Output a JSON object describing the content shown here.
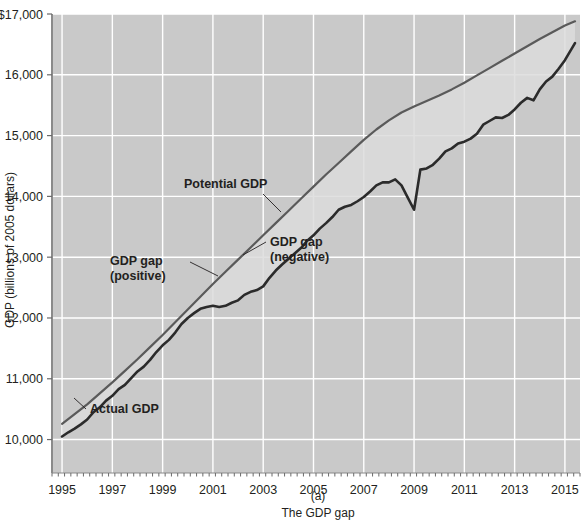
{
  "figure": {
    "caption_label": "(a)",
    "caption_text": "The GDP gap",
    "background": "#ffffff",
    "plot_background": "#c9c9c9",
    "gridline_color": "#ffffff",
    "potential_color": "#5a5a5a",
    "actual_color": "#2b2b2b",
    "gap_fill": "#dcdcdc"
  },
  "chart_data": {
    "type": "line",
    "title": "",
    "subtitle": "",
    "xlabel": "",
    "ylabel": "GDP (billions of 2005 dollars)",
    "xlim": [
      1994.6,
      2015.6
    ],
    "ylim": [
      9450,
      17000
    ],
    "grid": true,
    "legend": "none",
    "ytick_labels": [
      "$17,000",
      "16,000",
      "15,000",
      "14,000",
      "13,000",
      "12,000",
      "11,000",
      "10,000"
    ],
    "yticks": [
      17000,
      16000,
      15000,
      14000,
      13000,
      12000,
      11000,
      10000
    ],
    "xtick_labels": [
      "1995",
      "1997",
      "1999",
      "2001",
      "2003",
      "2005",
      "2007",
      "2009",
      "2011",
      "2013",
      "2015"
    ],
    "xticks": [
      1995,
      1997,
      1999,
      2001,
      2003,
      2005,
      2007,
      2009,
      2011,
      2013,
      2015
    ],
    "annotations": [
      {
        "name": "potential-gdp",
        "text": "Potential GDP",
        "x": 2000.6,
        "y": 13800
      },
      {
        "name": "gdp-gap-positive",
        "text_line1": "GDP gap",
        "text_line2": "(positive)",
        "x": 1999.2,
        "y": 12700
      },
      {
        "name": "gdp-gap-negative",
        "text_line1": "GDP gap",
        "text_line2": "(negative)",
        "x": 2003.3,
        "y": 12950
      },
      {
        "name": "actual-gdp",
        "text": "Actual GDP",
        "x": 1996.1,
        "y": 10050
      }
    ],
    "series": [
      {
        "name": "Potential GDP",
        "color": "#5a5a5a",
        "x": [
          1995.0,
          1995.5,
          1996.0,
          1996.5,
          1997.0,
          1997.5,
          1998.0,
          1998.5,
          1999.0,
          1999.5,
          2000.0,
          2000.5,
          2001.0,
          2001.5,
          2002.0,
          2002.5,
          2003.0,
          2003.5,
          2004.0,
          2004.5,
          2005.0,
          2005.5,
          2006.0,
          2006.5,
          2007.0,
          2007.5,
          2008.0,
          2008.5,
          2009.0,
          2009.5,
          2010.0,
          2010.5,
          2011.0,
          2011.5,
          2012.0,
          2012.5,
          2013.0,
          2013.5,
          2014.0,
          2014.5,
          2015.0,
          2015.4
        ],
        "values": [
          10260,
          10420,
          10580,
          10760,
          10940,
          11130,
          11320,
          11520,
          11720,
          11930,
          12140,
          12350,
          12560,
          12760,
          12960,
          13160,
          13360,
          13560,
          13760,
          13960,
          14160,
          14360,
          14550,
          14740,
          14930,
          15100,
          15250,
          15380,
          15480,
          15570,
          15660,
          15760,
          15870,
          15990,
          16110,
          16230,
          16350,
          16470,
          16590,
          16700,
          16810,
          16880
        ]
      },
      {
        "name": "Actual GDP",
        "color": "#2b2b2b",
        "x": [
          1995.0,
          1995.25,
          1995.5,
          1995.75,
          1996.0,
          1996.25,
          1996.5,
          1996.75,
          1997.0,
          1997.25,
          1997.5,
          1997.75,
          1998.0,
          1998.25,
          1998.5,
          1998.75,
          1999.0,
          1999.25,
          1999.5,
          1999.75,
          2000.0,
          2000.25,
          2000.5,
          2000.75,
          2001.0,
          2001.25,
          2001.5,
          2001.75,
          2002.0,
          2002.25,
          2002.5,
          2002.75,
          2003.0,
          2003.25,
          2003.5,
          2003.75,
          2004.0,
          2004.25,
          2004.5,
          2004.75,
          2005.0,
          2005.25,
          2005.5,
          2005.75,
          2006.0,
          2006.25,
          2006.5,
          2006.75,
          2007.0,
          2007.25,
          2007.5,
          2007.75,
          2008.0,
          2008.25,
          2008.5,
          2008.75,
          2009.0,
          2009.25,
          2009.5,
          2009.75,
          2010.0,
          2010.25,
          2010.5,
          2010.75,
          2011.0,
          2011.25,
          2011.5,
          2011.75,
          2012.0,
          2012.25,
          2012.5,
          2012.75,
          2013.0,
          2013.25,
          2013.5,
          2013.75,
          2014.0,
          2014.25,
          2014.5,
          2014.75,
          2015.0,
          2015.4
        ],
        "values": [
          10050,
          10120,
          10180,
          10250,
          10330,
          10450,
          10530,
          10640,
          10720,
          10830,
          10900,
          11010,
          11120,
          11200,
          11310,
          11440,
          11550,
          11640,
          11760,
          11900,
          12000,
          12080,
          12150,
          12180,
          12200,
          12180,
          12200,
          12250,
          12290,
          12380,
          12430,
          12460,
          12520,
          12660,
          12780,
          12880,
          12970,
          13060,
          13150,
          13270,
          13360,
          13470,
          13560,
          13660,
          13780,
          13830,
          13860,
          13920,
          13990,
          14080,
          14180,
          14230,
          14230,
          14280,
          14180,
          13980,
          13780,
          14440,
          14460,
          14520,
          14620,
          14740,
          14790,
          14870,
          14900,
          14950,
          15030,
          15180,
          15240,
          15300,
          15290,
          15340,
          15430,
          15540,
          15620,
          15580,
          15760,
          15890,
          15970,
          16100,
          16240,
          16520
        ]
      }
    ]
  }
}
